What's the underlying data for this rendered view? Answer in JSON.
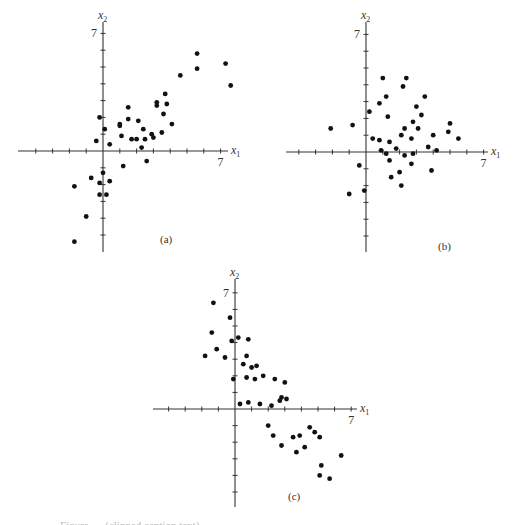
{
  "figure": {
    "caption_partial": "Figure … (clipped caption text)"
  },
  "chart_data": [
    {
      "type": "scatter",
      "panel_label": "(a)",
      "xlabel": "x1",
      "ylabel": "x2",
      "x_tick_label": "7",
      "y_tick_label": "7",
      "grid": false,
      "xlim": [
        -5,
        7.5
      ],
      "ylim": [
        -6,
        7.5
      ],
      "layout": {
        "origin_px": [
          103,
          151
        ],
        "unit_px": 16.8,
        "x_axis_px": [
          18,
          228
        ],
        "y_axis_px": [
          22,
          252
        ],
        "label_px": [
          160,
          243
        ]
      },
      "points": [
        [
          -0.4,
          0.6
        ],
        [
          -0.2,
          2.0
        ],
        [
          0.1,
          1.3
        ],
        [
          0.4,
          0.4
        ],
        [
          1.0,
          1.6
        ],
        [
          1.0,
          1.5
        ],
        [
          1.1,
          0.9
        ],
        [
          1.5,
          2.6
        ],
        [
          1.5,
          1.9
        ],
        [
          1.7,
          0.7
        ],
        [
          2.0,
          0.7
        ],
        [
          2.1,
          1.8
        ],
        [
          2.4,
          1.3
        ],
        [
          2.5,
          0.7
        ],
        [
          2.3,
          0.2
        ],
        [
          2.9,
          1.0
        ],
        [
          3.0,
          0.8
        ],
        [
          3.2,
          2.9
        ],
        [
          3.2,
          2.7
        ],
        [
          3.5,
          1.1
        ],
        [
          3.6,
          2.2
        ],
        [
          3.8,
          2.8
        ],
        [
          4.1,
          1.6
        ],
        [
          3.7,
          3.4
        ],
        [
          4.6,
          4.5
        ],
        [
          5.6,
          5.8
        ],
        [
          5.6,
          4.9
        ],
        [
          7.3,
          5.2
        ],
        [
          7.6,
          3.9
        ],
        [
          1.2,
          -0.9
        ],
        [
          2.6,
          -0.6
        ],
        [
          0.0,
          -1.3
        ],
        [
          -0.7,
          -1.6
        ],
        [
          -0.2,
          -1.9
        ],
        [
          0.4,
          -1.8
        ],
        [
          -1.7,
          -2.1
        ],
        [
          -0.2,
          -2.6
        ],
        [
          0.2,
          -2.6
        ],
        [
          -1.0,
          -3.9
        ],
        [
          -1.7,
          -5.4
        ]
      ]
    },
    {
      "type": "scatter",
      "panel_label": "(b)",
      "xlabel": "x1",
      "ylabel": "x2",
      "x_tick_label": "7",
      "y_tick_label": "7",
      "grid": false,
      "xlim": [
        -4.8,
        7.5
      ],
      "ylim": [
        -6,
        7.5
      ],
      "layout": {
        "origin_px": [
          366,
          152
        ],
        "unit_px": 16.8,
        "x_axis_px": [
          286,
          488
        ],
        "y_axis_px": [
          22,
          252
        ],
        "label_px": [
          438,
          250
        ]
      },
      "points": [
        [
          1.0,
          4.4
        ],
        [
          2.4,
          4.4
        ],
        [
          2.2,
          3.9
        ],
        [
          1.2,
          3.3
        ],
        [
          3.5,
          3.3
        ],
        [
          0.8,
          2.9
        ],
        [
          0.2,
          2.4
        ],
        [
          3.0,
          2.7
        ],
        [
          3.3,
          2.2
        ],
        [
          1.3,
          2.1
        ],
        [
          2.8,
          1.8
        ],
        [
          -2.1,
          1.4
        ],
        [
          -0.8,
          1.6
        ],
        [
          2.3,
          1.4
        ],
        [
          3.1,
          1.4
        ],
        [
          0.4,
          0.8
        ],
        [
          0.8,
          0.7
        ],
        [
          1.4,
          0.6
        ],
        [
          2.1,
          1.0
        ],
        [
          2.7,
          0.8
        ],
        [
          5.0,
          1.7
        ],
        [
          4.9,
          1.2
        ],
        [
          5.5,
          0.8
        ],
        [
          4.0,
          1.0
        ],
        [
          1.8,
          0.2
        ],
        [
          3.7,
          0.3
        ],
        [
          0.9,
          0.1
        ],
        [
          1.2,
          -0.1
        ],
        [
          2.3,
          -0.2
        ],
        [
          2.8,
          -0.1
        ],
        [
          4.2,
          0.1
        ],
        [
          1.4,
          -0.5
        ],
        [
          -0.4,
          -0.8
        ],
        [
          2.7,
          -0.7
        ],
        [
          2.0,
          -1.2
        ],
        [
          3.9,
          -1.1
        ],
        [
          1.5,
          -1.5
        ],
        [
          2.1,
          -2.0
        ],
        [
          -1.0,
          -2.5
        ],
        [
          -0.1,
          -2.3
        ]
      ]
    },
    {
      "type": "scatter",
      "panel_label": "(c)",
      "xlabel": "x1",
      "ylabel": "x2",
      "x_tick_label": "7",
      "y_tick_label": "7",
      "grid": false,
      "xlim": [
        -5,
        7.3
      ],
      "ylim": [
        -5.8,
        7.5
      ],
      "layout": {
        "origin_px": [
          235,
          409
        ],
        "unit_px": 16.6,
        "x_axis_px": [
          153,
          357
        ],
        "y_axis_px": [
          279,
          507
        ],
        "label_px": [
          288,
          500
        ]
      },
      "points": [
        [
          -1.3,
          6.4
        ],
        [
          -0.3,
          5.5
        ],
        [
          -1.4,
          4.6
        ],
        [
          -0.2,
          4.1
        ],
        [
          0.2,
          4.3
        ],
        [
          0.8,
          4.2
        ],
        [
          -1.1,
          3.6
        ],
        [
          -1.8,
          3.2
        ],
        [
          -0.6,
          3.1
        ],
        [
          0.7,
          3.2
        ],
        [
          0.5,
          2.7
        ],
        [
          1.0,
          2.5
        ],
        [
          1.3,
          2.6
        ],
        [
          -0.1,
          1.8
        ],
        [
          0.7,
          1.9
        ],
        [
          1.2,
          1.8
        ],
        [
          1.7,
          2.0
        ],
        [
          2.4,
          1.8
        ],
        [
          3.0,
          1.6
        ],
        [
          0.3,
          0.3
        ],
        [
          0.8,
          0.4
        ],
        [
          1.5,
          0.3
        ],
        [
          2.2,
          0.2
        ],
        [
          2.7,
          0.5
        ],
        [
          2.8,
          0.7
        ],
        [
          3.1,
          0.6
        ],
        [
          2.0,
          -1.0
        ],
        [
          2.3,
          -1.6
        ],
        [
          2.8,
          -2.2
        ],
        [
          3.5,
          -1.7
        ],
        [
          3.9,
          -1.6
        ],
        [
          3.7,
          -2.6
        ],
        [
          4.2,
          -2.3
        ],
        [
          4.5,
          -1.1
        ],
        [
          4.8,
          -1.4
        ],
        [
          5.1,
          -1.7
        ],
        [
          6.4,
          -2.8
        ],
        [
          5.2,
          -3.4
        ],
        [
          5.1,
          -4.0
        ],
        [
          5.7,
          -4.2
        ]
      ]
    }
  ]
}
